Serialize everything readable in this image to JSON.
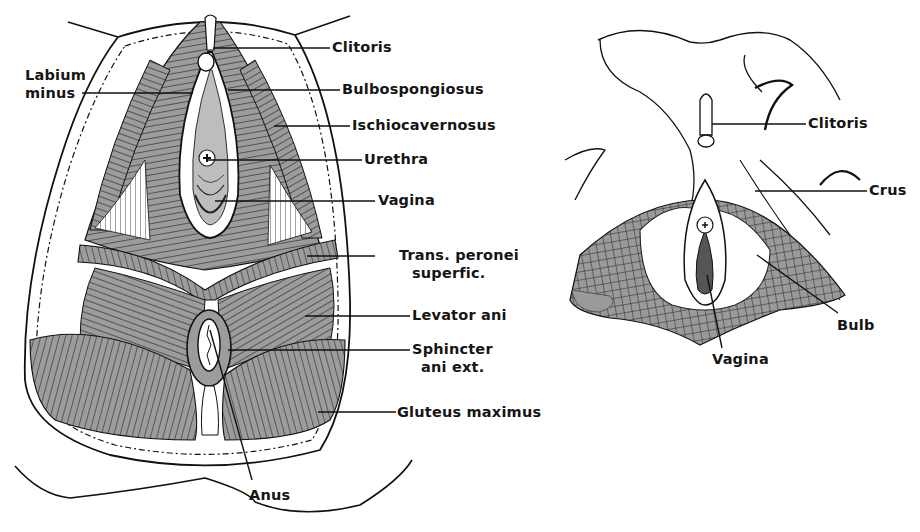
{
  "figure": {
    "left_panel": {
      "name": "Female perineum - superficial muscles",
      "labels": [
        {
          "id": "clitoris",
          "text": "Clitoris"
        },
        {
          "id": "labium_minus",
          "line1": "Labium",
          "line2": "minus"
        },
        {
          "id": "bulbospongiosus",
          "text": "Bulbospongiosus"
        },
        {
          "id": "ischiocavernosus",
          "text": "Ischiocavernosus"
        },
        {
          "id": "urethra",
          "text": "Urethra"
        },
        {
          "id": "vagina",
          "text": "Vagina"
        },
        {
          "id": "trans_peronei",
          "line1": "Trans. peronei",
          "line2": "superfic."
        },
        {
          "id": "levator_ani",
          "text": "Levator ani"
        },
        {
          "id": "sphincter",
          "line1": "Sphincter",
          "line2": "ani ext."
        },
        {
          "id": "gluteus",
          "text": "Gluteus maximus"
        },
        {
          "id": "anus",
          "text": "Anus"
        }
      ]
    },
    "right_panel": {
      "name": "Female external genitalia - erectile tissue",
      "labels": [
        {
          "id": "clitoris",
          "text": "Clitoris"
        },
        {
          "id": "crus",
          "text": "Crus"
        },
        {
          "id": "bulb",
          "text": "Bulb"
        },
        {
          "id": "vagina",
          "text": "Vagina"
        }
      ]
    },
    "colors": {
      "ink": "#151515",
      "muscle": "#9a9a9a",
      "background": "#ffffff"
    }
  }
}
